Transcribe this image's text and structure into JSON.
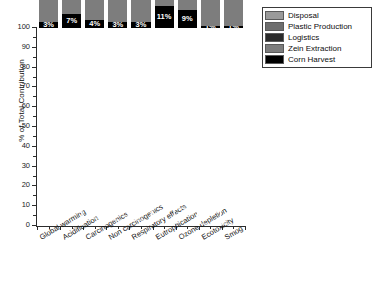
{
  "chart_data": {
    "type": "bar",
    "stacked": true,
    "title": "",
    "xlabel": "",
    "ylabel": "% of Total Contribution",
    "ylim": [
      0,
      100
    ],
    "yticks": [
      0,
      10,
      20,
      30,
      40,
      50,
      60,
      70,
      80,
      90,
      100
    ],
    "grid": false,
    "legend_position": "top-right",
    "categories": [
      "Global warming",
      "Acidification",
      "Carcinogenics",
      "Non carcinogenics",
      "Respiratory effects",
      "Eutrophication",
      "Ozone depletion",
      "Ecotoxicity",
      "Smog"
    ],
    "series": [
      {
        "name": "Corn Harvest",
        "color": "#000000",
        "values": [
          3,
          7,
          4,
          3,
          3,
          11,
          9,
          1,
          1
        ],
        "labels": [
          "3%",
          "7%",
          "4%",
          "3%",
          "3%",
          "11%",
          "9%",
          "1%",
          "1%"
        ]
      },
      {
        "name": "Zein Extraction",
        "color": "#7d7d7d",
        "values": [
          41,
          49,
          27,
          34,
          54,
          72,
          65,
          32,
          56
        ],
        "labels": [
          "41%",
          "49%",
          "27%",
          "34%",
          "54%",
          "72%",
          "65%",
          "32%",
          "56%"
        ]
      },
      {
        "name": "Logistics",
        "color": "#2b2b2b",
        "values": [
          46,
          34,
          61,
          48,
          29,
          7,
          4,
          41,
          35
        ],
        "labels": [
          "46%",
          "34%",
          "61%",
          "48%",
          "29%",
          "7%",
          "4%",
          "41%",
          "35%"
        ]
      },
      {
        "name": "Plastic Production",
        "color": "#6e6e6e",
        "values": [
          1,
          1,
          0,
          1,
          0,
          2,
          0,
          0,
          2
        ],
        "labels": [
          "",
          "",
          "",
          "",
          "",
          "",
          "",
          "",
          ""
        ]
      },
      {
        "name": "Disposal",
        "color": "#9a9a9a",
        "values": [
          9,
          9,
          8,
          14,
          14,
          8,
          22,
          26,
          6
        ],
        "labels": [
          "9%",
          "9%",
          "8%",
          "14%",
          "14%",
          "8%",
          "22%",
          "26%",
          "6%"
        ]
      }
    ]
  },
  "legend": {
    "items": [
      {
        "label": "Disposal",
        "swatch": "disposal"
      },
      {
        "label": "Plastic Production",
        "swatch": "plastic"
      },
      {
        "label": "Logistics",
        "swatch": "logistics"
      },
      {
        "label": "Zein Extraction",
        "swatch": "zein"
      },
      {
        "label": "Corn Harvest",
        "swatch": "corn"
      }
    ]
  },
  "axes": {
    "y_title": "% of Total Contribution",
    "y_tick_labels": [
      "100",
      "90",
      "80",
      "70",
      "60",
      "50",
      "40",
      "30",
      "20",
      "10",
      "0"
    ]
  }
}
